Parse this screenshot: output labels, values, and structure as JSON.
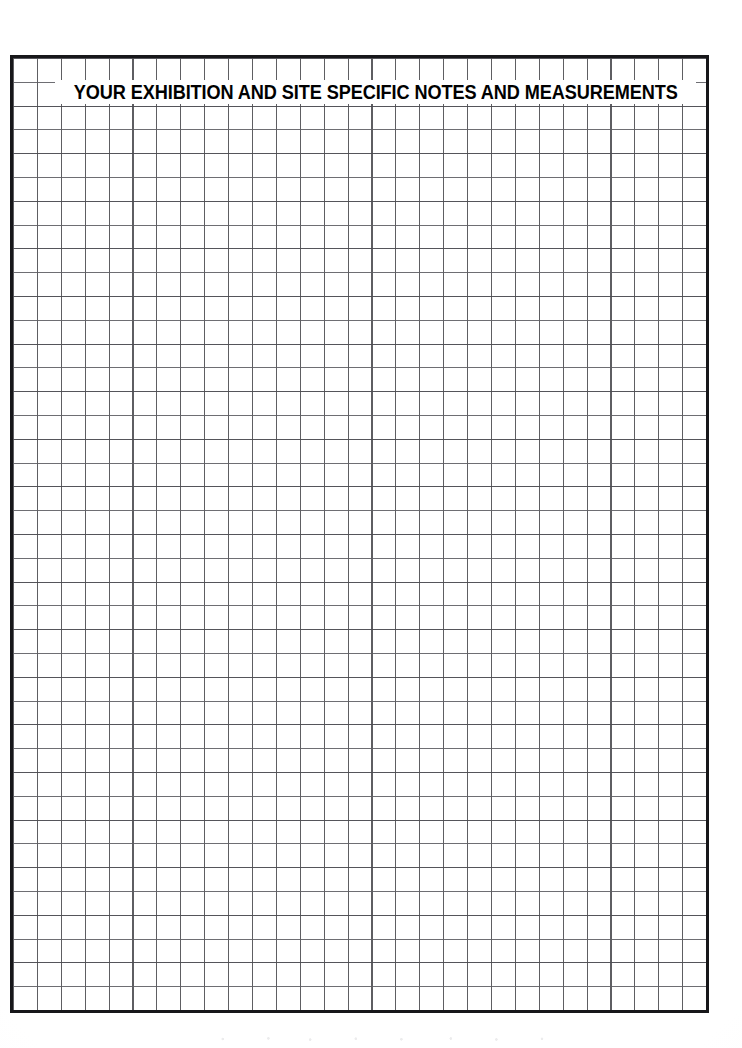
{
  "document": {
    "type": "grid-worksheet",
    "title": "YOUR EXHIBITION AND SITE SPECIFIC NOTES AND MEASUREMENTS",
    "page_background": "#ffffff"
  },
  "grid": {
    "columns": 29,
    "rows": 40,
    "cell_width_px": 24,
    "cell_height_px": 24,
    "line_color": "#6e6e73",
    "vertical_line_color": "#5e5e62",
    "border_color": "#17171a",
    "border_width_px": 3,
    "left_px": 10,
    "top_px": 55,
    "width_px": 699,
    "height_px": 958
  },
  "title_band": {
    "background": "#ffffff",
    "text_color": "#000000",
    "left_px": 55,
    "top_px": 80,
    "width_px": 641,
    "height_px": 24
  }
}
